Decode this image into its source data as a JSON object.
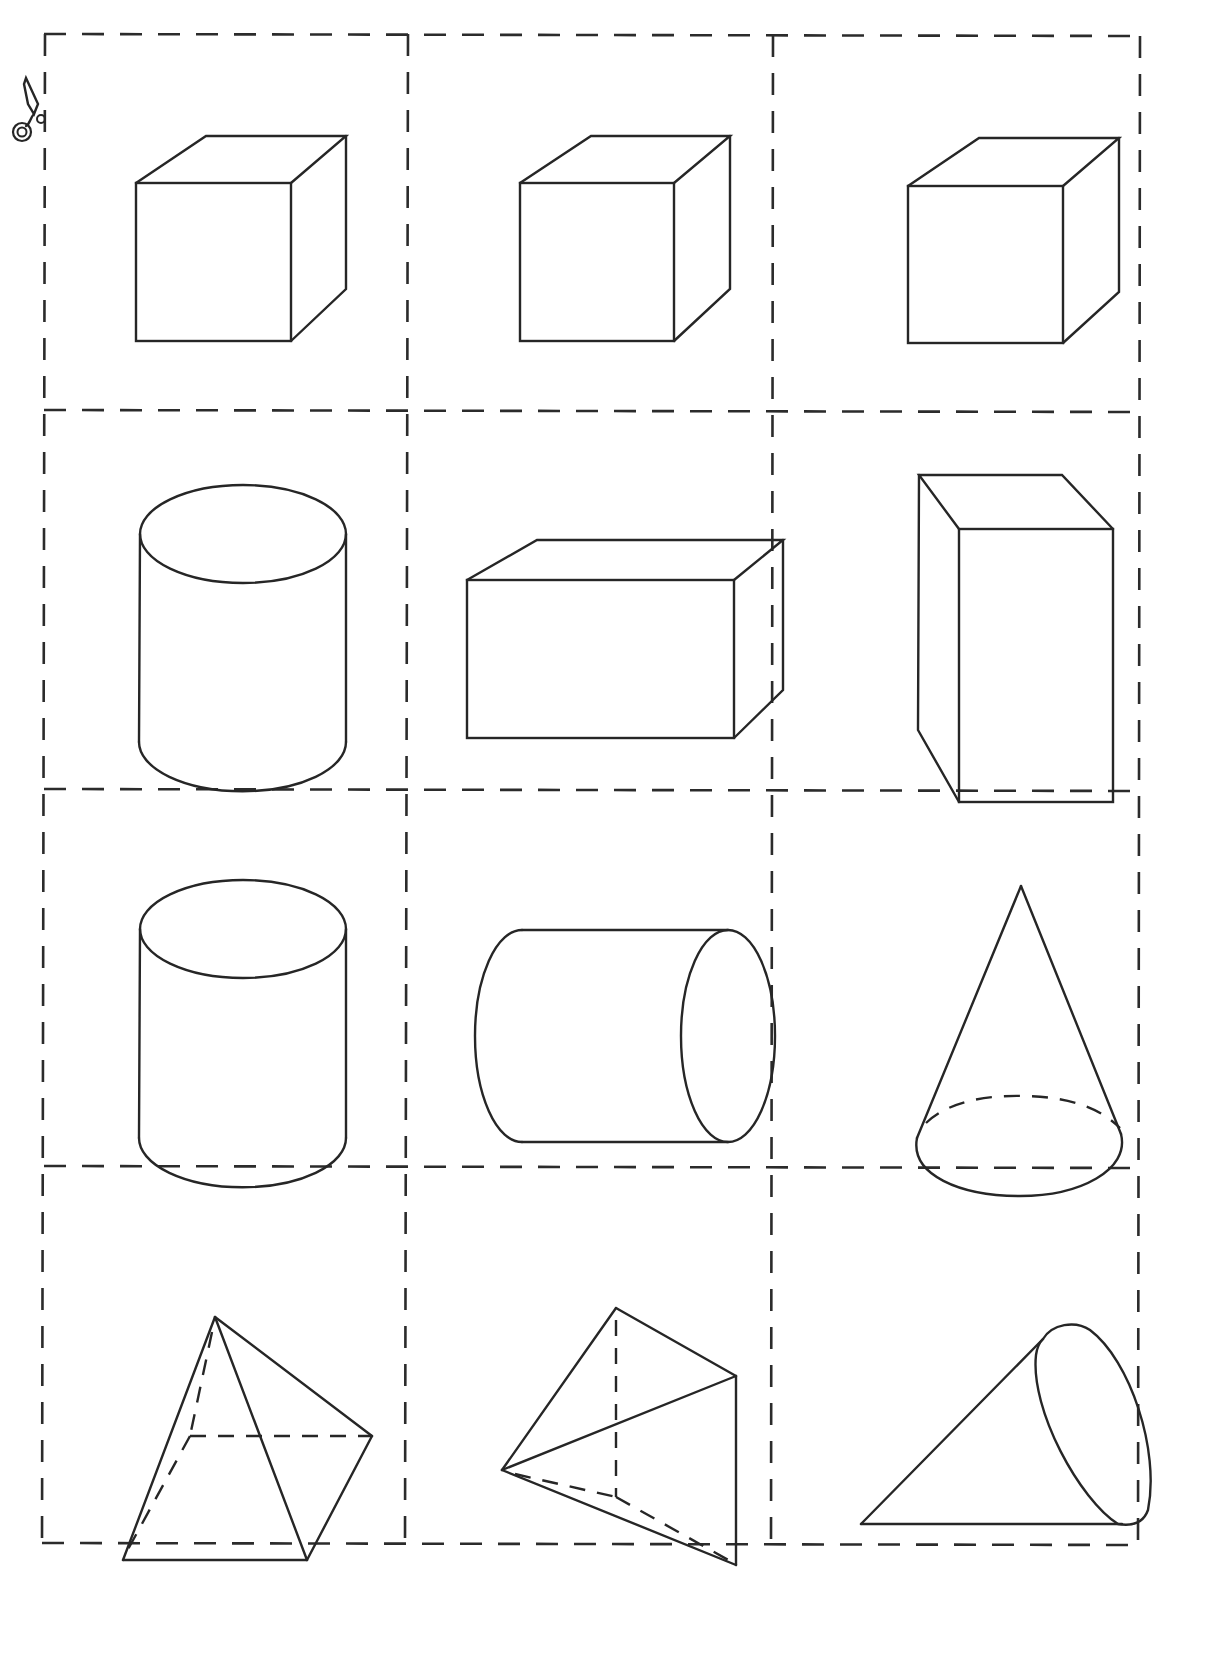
{
  "sheet": {
    "kind": "cut-out cards of 3D solids",
    "colors": {
      "background": "#ffffff",
      "ink": "#262626",
      "cut_line": "#2b2b2b"
    },
    "grid": {
      "columns": 3,
      "rows": 4,
      "x_lines": [
        44,
        408,
        774,
        1140
      ],
      "y_lines": [
        34,
        410,
        790,
        1168,
        1545
      ]
    },
    "scissors_icon": {
      "name": "scissors-icon",
      "x": 10,
      "y": 75
    }
  },
  "cards": [
    {
      "row": 1,
      "col": 1,
      "shape": "cube"
    },
    {
      "row": 1,
      "col": 2,
      "shape": "cube"
    },
    {
      "row": 1,
      "col": 3,
      "shape": "cube"
    },
    {
      "row": 2,
      "col": 1,
      "shape": "cylinder (upright)"
    },
    {
      "row": 2,
      "col": 2,
      "shape": "rectangular prism (horizontal)"
    },
    {
      "row": 2,
      "col": 3,
      "shape": "rectangular prism (vertical)"
    },
    {
      "row": 3,
      "col": 1,
      "shape": "cylinder (upright)"
    },
    {
      "row": 3,
      "col": 2,
      "shape": "cylinder (lying on side)"
    },
    {
      "row": 3,
      "col": 3,
      "shape": "cone (upright)"
    },
    {
      "row": 4,
      "col": 1,
      "shape": "square pyramid"
    },
    {
      "row": 4,
      "col": 2,
      "shape": "triangular pyramid (tetrahedron)"
    },
    {
      "row": 4,
      "col": 3,
      "shape": "cone (lying on side)"
    }
  ]
}
